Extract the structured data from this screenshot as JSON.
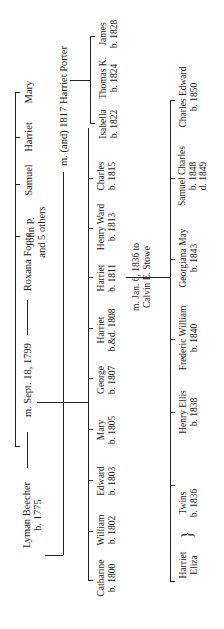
{
  "orientation": "rotated 90deg counterclockwise",
  "lyman": {
    "name": "Lyman Beecher",
    "born": "b. 1775"
  },
  "marriage1": {
    "label": "m. Sept. 18, 1799",
    "spouse": "Roxana Foote"
  },
  "marriage2": {
    "label": "m. (and) 1817 Harriet Porter"
  },
  "roxana_parents_children": [
    {
      "name": "John P.",
      "note": "and 5 others"
    },
    {
      "name": "Samuel"
    },
    {
      "name": "Harriet"
    },
    {
      "name": "Mary"
    }
  ],
  "children_first": [
    {
      "name": "Catharine",
      "dates": "b. 1800"
    },
    {
      "name": "William",
      "dates": "b. 1802"
    },
    {
      "name": "Edward",
      "dates": "b. 1803"
    },
    {
      "name": "Mary",
      "dates": "b. 1805"
    },
    {
      "name": "George",
      "dates": "b. 1807"
    },
    {
      "name": "Harriet",
      "dates": "b.&d. 1808"
    },
    {
      "name": "Harriet",
      "dates": "b. 1811"
    },
    {
      "name": "Henry Ward",
      "dates": "b. 1813"
    },
    {
      "name": "Charles",
      "dates": "b. 1815"
    }
  ],
  "children_second": [
    {
      "name": "Isabella",
      "dates": "b. 1822"
    },
    {
      "name": "Thomas K.",
      "dates": "b. 1824"
    },
    {
      "name": "James",
      "dates": "b. 1828"
    }
  ],
  "stowe_marriage": {
    "line1": "m. Jan. 6, 1836 to",
    "line2": "Calvin E. Stowe"
  },
  "stowe_children": [
    {
      "name": "Harriet",
      "name2": "Eliza",
      "brace": "}",
      "twins": "Twins",
      "dates": "b. 1836"
    },
    {
      "name": "Henry Ellis",
      "dates": "b. 1838"
    },
    {
      "name": "Frederic William",
      "dates": "b. 1840"
    },
    {
      "name": "Georgiana May",
      "dates": "b. 1843"
    },
    {
      "name": "Samuel Charles",
      "dates": "b. 1848",
      "dates2": "d. 1849"
    },
    {
      "name": "Charles Edward",
      "dates": "b. 1850"
    }
  ]
}
